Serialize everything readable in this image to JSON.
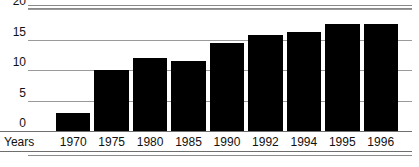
{
  "chart_data": {
    "type": "bar",
    "title": "",
    "xlabel": "Years",
    "ylabel": "",
    "categories": [
      "1970",
      "1975",
      "1980",
      "1985",
      "1990",
      "1992",
      "1994",
      "1995",
      "1996"
    ],
    "values": [
      3,
      10,
      12,
      11.5,
      14.5,
      15.8,
      16.2,
      17.6,
      17.6
    ],
    "ylim": [
      0,
      20
    ],
    "yticks": [
      "0",
      "5",
      "10",
      "15",
      "20"
    ],
    "ytick_values": [
      0,
      5,
      10,
      15,
      20
    ],
    "grid": true,
    "legend": "none",
    "bar_color": "#000000",
    "grid_color": "#9a9a9a",
    "axis_color": "#6f6f6f",
    "text_color": "#111111"
  }
}
